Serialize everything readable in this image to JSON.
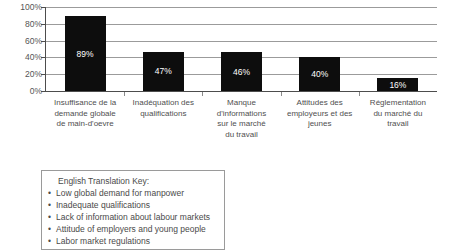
{
  "chart_data": {
    "type": "bar",
    "title": "",
    "xlabel": "",
    "ylabel": "",
    "ylim": [
      0,
      100
    ],
    "grid": true,
    "legend": "none",
    "categories": [
      "Insuffisance de la demande globale de main-d'oevre",
      "Inadéquation des qualifications",
      "Manque d'informations sur le marché du travail",
      "Attitudes des employeurs et des jeunes",
      "Réglementation du marché du travail"
    ],
    "category_lines": [
      [
        "Insuffisance de la",
        "demande globale",
        "de main-d'oevre"
      ],
      [
        "Inadéquation des",
        "qualifications"
      ],
      [
        "Manque",
        "d'informations",
        "sur le marché",
        "du travail"
      ],
      [
        "Attitudes des",
        "employeurs et des",
        "jeunes"
      ],
      [
        "Réglementation",
        "du marché du",
        "travail"
      ]
    ],
    "values": [
      89,
      47,
      46,
      40,
      16
    ],
    "value_labels": [
      "89%",
      "47%",
      "46%",
      "40%",
      "16%"
    ],
    "y_ticks": [
      100,
      80,
      60,
      40,
      20,
      0
    ],
    "y_tick_labels": [
      "100%",
      "80%",
      "60%",
      "40%",
      "20%",
      "0%"
    ],
    "bar_color": "#0d0d0d",
    "value_label_color": "#ffffff",
    "gridline_color": "#9b9b9b",
    "axis_color": "#4d4d4d"
  },
  "translation_key": {
    "title": "English Translation Key:",
    "bullet": "•",
    "items": [
      "Low global demand for manpower",
      "Inadequate qualifications",
      "Lack of information about labour markets",
      "Attitude of employers and young people",
      "Labor market regulations"
    ]
  }
}
